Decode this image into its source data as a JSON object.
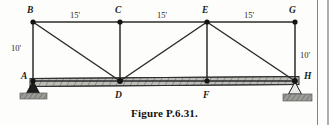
{
  "figure": {
    "caption": "Figure P.6.31."
  },
  "nodes": [
    {
      "id": "B",
      "label": "B",
      "x": 33,
      "y": 22,
      "label_x": 27,
      "label_y": 6,
      "chord": "top"
    },
    {
      "id": "C",
      "label": "C",
      "x": 120,
      "y": 22,
      "label_x": 115,
      "label_y": 6,
      "chord": "top"
    },
    {
      "id": "E",
      "label": "E",
      "x": 207,
      "y": 22,
      "label_x": 202,
      "label_y": 6,
      "chord": "top"
    },
    {
      "id": "G",
      "label": "G",
      "x": 295,
      "y": 22,
      "label_x": 289,
      "label_y": 6,
      "chord": "top"
    },
    {
      "id": "A",
      "label": "A",
      "x": 33,
      "y": 81,
      "label_x": 21,
      "label_y": 73,
      "chord": "bottom"
    },
    {
      "id": "D",
      "label": "D",
      "x": 120,
      "y": 81,
      "label_x": 115,
      "label_y": 92,
      "chord": "bottom"
    },
    {
      "id": "F",
      "label": "F",
      "x": 207,
      "y": 81,
      "label_x": 203,
      "label_y": 92,
      "chord": "bottom"
    },
    {
      "id": "H",
      "label": "H",
      "x": 295,
      "y": 81,
      "label_x": 304,
      "label_y": 73,
      "chord": "bottom"
    }
  ],
  "members": [
    {
      "name": "top-chord-B-C",
      "from": "B",
      "to": "C",
      "kind": "chord"
    },
    {
      "name": "top-chord-C-E",
      "from": "C",
      "to": "E",
      "kind": "chord"
    },
    {
      "name": "top-chord-E-G",
      "from": "E",
      "to": "G",
      "kind": "chord"
    },
    {
      "name": "vertical-A-B",
      "from": "A",
      "to": "B",
      "kind": "vertical"
    },
    {
      "name": "vertical-C-D",
      "from": "C",
      "to": "D",
      "kind": "vertical"
    },
    {
      "name": "vertical-E-F",
      "from": "E",
      "to": "F",
      "kind": "vertical"
    },
    {
      "name": "vertical-G-H",
      "from": "G",
      "to": "H",
      "kind": "vertical"
    },
    {
      "name": "diagonal-B-D",
      "from": "B",
      "to": "D",
      "kind": "diagonal"
    },
    {
      "name": "diagonal-D-E",
      "from": "D",
      "to": "E",
      "kind": "diagonal"
    },
    {
      "name": "diagonal-E-H",
      "from": "E",
      "to": "H",
      "kind": "diagonal"
    },
    {
      "name": "bottom-chord-A-H",
      "from": "A",
      "to": "H",
      "kind": "beam"
    }
  ],
  "dimensions": [
    {
      "name": "span-B-C",
      "value": "15'",
      "x": 77,
      "y": 12,
      "orientation": "horizontal"
    },
    {
      "name": "span-C-E",
      "value": "15'",
      "x": 164,
      "y": 12,
      "orientation": "horizontal"
    },
    {
      "name": "span-E-G",
      "value": "15'",
      "x": 251,
      "y": 12,
      "orientation": "horizontal"
    },
    {
      "name": "height-A-B",
      "value": "10'",
      "x": 11,
      "y": 45,
      "orientation": "vertical"
    },
    {
      "name": "height-G-H",
      "value": "10'",
      "x": 300,
      "y": 52,
      "orientation": "vertical"
    }
  ],
  "supports": [
    {
      "name": "pin-support-A",
      "at": "A",
      "type": "pin",
      "x": 33,
      "y": 81
    },
    {
      "name": "roller-support-H",
      "at": "H",
      "type": "roller",
      "x": 295,
      "y": 81
    }
  ],
  "colors": {
    "member": "#2b2b2b",
    "beam_fill": "#b9b9b4",
    "beam_edge": "#3a3a3a",
    "hatch": "#6a6a66",
    "node": "#141414",
    "ground": "#8e8e8a",
    "background": "#fdfdfc",
    "text": "#1a1a1a"
  }
}
